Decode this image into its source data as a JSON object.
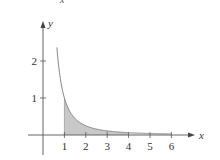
{
  "top_fragment": "x",
  "chart_data": {
    "type": "area",
    "title": "",
    "function": "y = 1/x^2",
    "xlabel": "x",
    "ylabel": "y",
    "x_ticks": [
      1,
      2,
      3,
      4,
      5,
      6
    ],
    "y_ticks": [
      1,
      2
    ],
    "xlim": [
      -0.8,
      7
    ],
    "ylim": [
      -0.4,
      2.8
    ],
    "grid": false,
    "curve": {
      "x_start": 0.65,
      "x_end": 6,
      "points": [
        {
          "x": 0.65,
          "y": 2.37
        },
        {
          "x": 0.75,
          "y": 1.78
        },
        {
          "x": 1,
          "y": 1.0
        },
        {
          "x": 1.5,
          "y": 0.44
        },
        {
          "x": 2,
          "y": 0.25
        },
        {
          "x": 3,
          "y": 0.11
        },
        {
          "x": 4,
          "y": 0.06
        },
        {
          "x": 5,
          "y": 0.04
        },
        {
          "x": 6,
          "y": 0.03
        }
      ]
    },
    "shaded_region": {
      "x_from": 1,
      "x_to": 4,
      "fill": "#c8c8c8"
    },
    "light_region": {
      "x_from": 4,
      "x_to": 6,
      "fill": "#f0f0f0"
    },
    "colors": {
      "axis": "#555555",
      "curve": "#777777",
      "shade": "#c8c8c8"
    }
  }
}
